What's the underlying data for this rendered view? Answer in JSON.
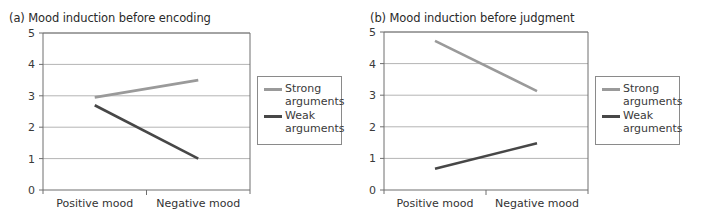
{
  "colors": {
    "strong": "#9a9a9a",
    "weak": "#474747",
    "grid": "#b4b4b4",
    "axis": "#6e6e6e"
  },
  "panels": [
    {
      "title": "(a)  Mood induction before encoding",
      "legend": [
        "Strong arguments",
        "Weak arguments"
      ]
    },
    {
      "title": "(b)  Mood induction before judgment",
      "legend": [
        "Strong arguments",
        "Weak arguments"
      ]
    }
  ],
  "legend_labels": {
    "strong_line1": "Strong",
    "strong_line2": "arguments",
    "weak_line1": "Weak",
    "weak_line2": "arguments"
  },
  "chart_data": [
    {
      "type": "line",
      "title": "(a) Mood induction before encoding",
      "categories": [
        "Positive mood",
        "Negative mood"
      ],
      "series": [
        {
          "name": "Strong arguments",
          "values": [
            2.95,
            3.5
          ]
        },
        {
          "name": "Weak arguments",
          "values": [
            2.7,
            1.0
          ]
        }
      ],
      "xlabel": "",
      "ylabel": "",
      "ylim": [
        0,
        5
      ],
      "yticks": [
        0,
        1,
        2,
        3,
        4,
        5
      ],
      "grid": true,
      "legend_position": "right"
    },
    {
      "type": "line",
      "title": "(b) Mood induction before judgment",
      "categories": [
        "Positive mood",
        "Negative mood"
      ],
      "series": [
        {
          "name": "Strong arguments",
          "values": [
            4.72,
            3.13
          ]
        },
        {
          "name": "Weak arguments",
          "values": [
            0.67,
            1.48
          ]
        }
      ],
      "xlabel": "",
      "ylabel": "",
      "ylim": [
        0,
        5
      ],
      "yticks": [
        0,
        1,
        2,
        3,
        4,
        5
      ],
      "grid": true,
      "legend_position": "right"
    }
  ]
}
